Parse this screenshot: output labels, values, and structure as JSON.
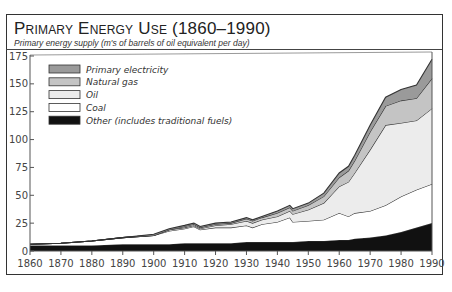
{
  "title": "Primary Energy Use (1860–1990)",
  "subtitle": "Primary energy supply (m's of barrels of oil equivalent per day)",
  "colors": {
    "primary_electricity": "#9a9a9a",
    "natural_gas": "#c4c4c4",
    "oil": "#ececec",
    "coal": "#ffffff",
    "other": "#111111",
    "line": "#333333"
  },
  "legend": [
    {
      "label": "Primary electricity",
      "color": "#9a9a9a"
    },
    {
      "label": "Natural gas",
      "color": "#c4c4c4"
    },
    {
      "label": "Oil",
      "color": "#ececec"
    },
    {
      "label": "Coal",
      "color": "#ffffff"
    },
    {
      "label": "Other (includes traditional fuels)",
      "color": "#111111"
    }
  ],
  "y_ticks": [
    "0",
    "25",
    "50",
    "75",
    "100",
    "125",
    "150",
    "175"
  ],
  "x_ticks": [
    "1860",
    "1870",
    "1880",
    "1890",
    "1900",
    "1910",
    "1920",
    "1930",
    "1940",
    "1950",
    "1960",
    "1970",
    "1980",
    "1990"
  ],
  "chart_data": {
    "type": "area",
    "stacked": true,
    "title": "Primary Energy Use (1860–1990)",
    "subtitle": "Primary energy supply (m's of barrels of oil equivalent per day)",
    "xlabel": "",
    "ylabel": "m's of barrels of oil equivalent per day",
    "xlim": [
      1860,
      1990
    ],
    "ylim": [
      0,
      175
    ],
    "grid": false,
    "legend_position": "upper-left inside",
    "x": [
      1860,
      1870,
      1880,
      1890,
      1900,
      1905,
      1910,
      1913,
      1915,
      1920,
      1925,
      1930,
      1932,
      1935,
      1940,
      1944,
      1945,
      1950,
      1955,
      1960,
      1963,
      1965,
      1970,
      1975,
      1980,
      1985,
      1990
    ],
    "series": [
      {
        "name": "Other (includes traditional fuels)",
        "values": [
          5,
          5,
          5,
          6,
          6,
          6,
          7,
          7,
          7,
          7,
          7,
          8,
          8,
          8,
          8,
          8,
          8,
          9,
          9,
          10,
          10,
          11,
          12,
          14,
          17,
          21,
          25
        ]
      },
      {
        "name": "Coal",
        "values": [
          1,
          2,
          4,
          6,
          8,
          12,
          13,
          15,
          12,
          14,
          14,
          15,
          13,
          16,
          18,
          22,
          18,
          18,
          19,
          24,
          21,
          23,
          24,
          27,
          32,
          34,
          35
        ]
      },
      {
        "name": "Oil",
        "values": [
          0,
          0,
          0,
          0,
          0,
          1,
          1,
          1,
          1,
          2,
          3,
          4,
          4,
          4,
          5,
          6,
          7,
          10,
          15,
          24,
          31,
          36,
          55,
          72,
          66,
          62,
          68
        ]
      },
      {
        "name": "Natural gas",
        "values": [
          0,
          0,
          0,
          0,
          0,
          0,
          1,
          1,
          1,
          1,
          1,
          2,
          2,
          2,
          3,
          3,
          3,
          4,
          6,
          8,
          10,
          11,
          16,
          17,
          20,
          20,
          27
        ]
      },
      {
        "name": "Primary electricity",
        "values": [
          0,
          0,
          0,
          0,
          1,
          1,
          1,
          1,
          1,
          1,
          1,
          1,
          1,
          1,
          2,
          2,
          2,
          2,
          3,
          4,
          4,
          5,
          6,
          8,
          10,
          12,
          17
        ]
      }
    ]
  }
}
